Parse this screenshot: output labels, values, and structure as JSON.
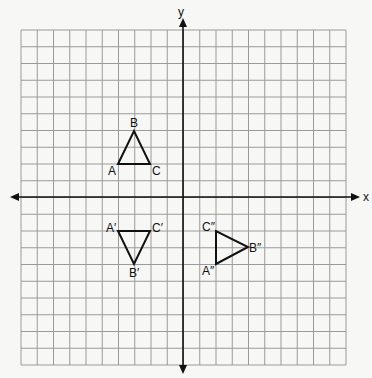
{
  "axes": {
    "x_label": "x",
    "y_label": "y"
  },
  "grid": {
    "cols": 20,
    "rows": 20,
    "xmin": -10,
    "xmax": 10,
    "ymin": -10,
    "ymax": 10
  },
  "triangles": [
    {
      "name": "ABC",
      "vertices": [
        {
          "label": "A",
          "x": -4,
          "y": 2
        },
        {
          "label": "B",
          "x": -3,
          "y": 4
        },
        {
          "label": "C",
          "x": -2,
          "y": 2
        }
      ]
    },
    {
      "name": "A'B'C'",
      "vertices": [
        {
          "label": "A′",
          "x": -4,
          "y": -2
        },
        {
          "label": "B′",
          "x": -3,
          "y": -4
        },
        {
          "label": "C′",
          "x": -2,
          "y": -2
        }
      ]
    },
    {
      "name": "A''B''C''",
      "vertices": [
        {
          "label": "A″",
          "x": 2,
          "y": -4
        },
        {
          "label": "B″",
          "x": 4,
          "y": -3
        },
        {
          "label": "C″",
          "x": 2,
          "y": -2
        }
      ]
    }
  ],
  "labels": {
    "A": "A",
    "B": "B",
    "C": "C",
    "A1": "A′",
    "B1": "B′",
    "C1": "C′",
    "A2": "A″",
    "B2": "B″",
    "C2": "C″"
  }
}
